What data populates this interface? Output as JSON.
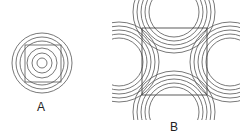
{
  "figures": [
    {
      "label": "A",
      "description": "Concentric circles with inscribed square",
      "center": [
        42,
        62
      ],
      "circle_radii": [
        30,
        26,
        22,
        15,
        10,
        5
      ],
      "square": {
        "x": 24,
        "y": 44,
        "size": 37
      }
    },
    {
      "label": "B",
      "description": "Square with concentric arc groups centered beyond each side",
      "square": {
        "x": 142,
        "y": 28,
        "size": 65
      },
      "arc_radii": [
        24,
        28,
        32,
        36,
        40
      ]
    }
  ],
  "colors": {
    "stroke": "#555555",
    "background": "#ffffff",
    "text": "#222222"
  }
}
